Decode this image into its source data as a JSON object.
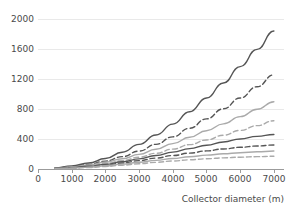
{
  "chart_data": {
    "type": "line",
    "title": "",
    "xlabel": "Collector diameter (m)",
    "ylabel": "",
    "xlim": [
      0,
      7300
    ],
    "ylim": [
      0,
      2100
    ],
    "grid": true,
    "legend": "none",
    "x_ticks": [
      0,
      1000,
      2000,
      3000,
      4000,
      5000,
      6000,
      7000
    ],
    "x_tick_labels": [
      "0",
      "1000",
      "2000",
      "3000",
      "4000",
      "5000",
      "6000",
      "7000"
    ],
    "y_ticks": [
      0,
      400,
      800,
      1200,
      1600,
      2000
    ],
    "y_tick_labels": [
      "0",
      "400",
      "800",
      "1200",
      "1600",
      "2000"
    ],
    "x": [
      500,
      1000,
      1500,
      2000,
      2500,
      3000,
      3500,
      4000,
      4500,
      5000,
      5500,
      6000,
      6500,
      7000
    ],
    "series": [
      {
        "name": "series-1",
        "style": "solid",
        "color": "#555555",
        "width": 1.4,
        "values": [
          15,
          40,
          80,
          140,
          225,
          330,
          455,
          600,
          765,
          950,
          1150,
          1370,
          1600,
          1845
        ]
      },
      {
        "name": "series-2",
        "style": "dashed",
        "color": "#555555",
        "width": 1.4,
        "values": [
          12,
          32,
          62,
          105,
          165,
          240,
          330,
          430,
          545,
          670,
          805,
          950,
          1100,
          1260
        ]
      },
      {
        "name": "series-3",
        "style": "solid",
        "color": "#aaaaaa",
        "width": 1.4,
        "values": [
          10,
          28,
          54,
          90,
          138,
          196,
          264,
          340,
          424,
          512,
          604,
          700,
          800,
          900
        ]
      },
      {
        "name": "series-4",
        "style": "dashed",
        "color": "#aaaaaa",
        "width": 1.4,
        "values": [
          8,
          22,
          44,
          74,
          112,
          158,
          210,
          266,
          326,
          388,
          452,
          516,
          580,
          645
        ]
      },
      {
        "name": "series-5",
        "style": "solid",
        "color": "#555555",
        "width": 1.4,
        "values": [
          6,
          18,
          36,
          62,
          96,
          136,
          180,
          226,
          272,
          318,
          362,
          402,
          436,
          462
        ]
      },
      {
        "name": "series-6",
        "style": "dashed",
        "color": "#555555",
        "width": 1.4,
        "values": [
          5,
          15,
          30,
          52,
          80,
          112,
          146,
          180,
          212,
          242,
          268,
          290,
          308,
          322
        ]
      },
      {
        "name": "series-7",
        "style": "solid",
        "color": "#aaaaaa",
        "width": 1.4,
        "values": [
          4,
          12,
          25,
          43,
          65,
          90,
          116,
          141,
          164,
          185,
          203,
          218,
          230,
          240
        ]
      },
      {
        "name": "series-8",
        "style": "dashed",
        "color": "#aaaaaa",
        "width": 1.4,
        "values": [
          3,
          10,
          20,
          34,
          51,
          70,
          89,
          107,
          123,
          137,
          149,
          158,
          165,
          170
        ]
      }
    ]
  }
}
